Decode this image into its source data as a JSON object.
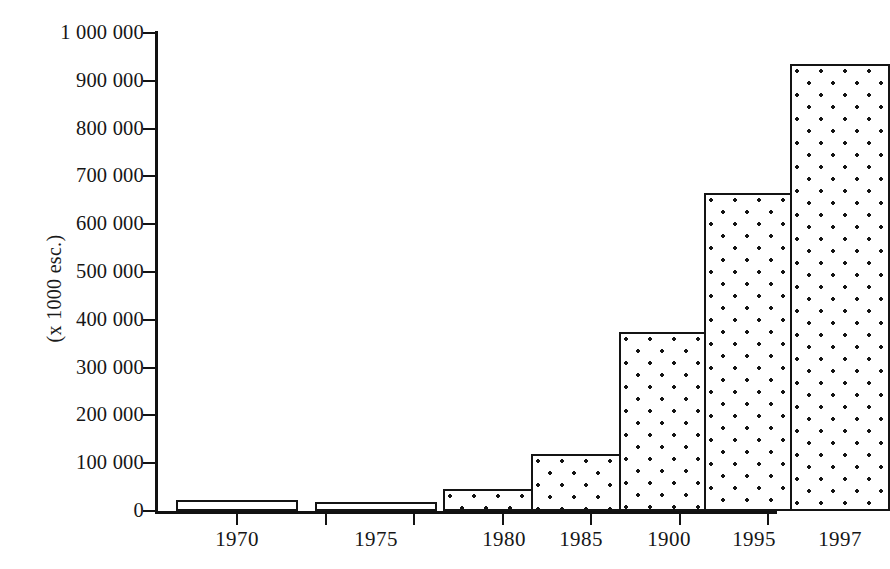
{
  "chart_data": {
    "type": "bar",
    "title": "",
    "subtitle": "",
    "xlabel": "",
    "ylabel": "(x 1000 esc.)",
    "categories": [
      "1970",
      "1975",
      "1980",
      "1985",
      "1900",
      "1995",
      "1997"
    ],
    "values": [
      22000,
      18000,
      45000,
      120000,
      375000,
      665000,
      935000
    ],
    "ylim": [
      0,
      1000000
    ],
    "ytick_values": [
      0,
      100000,
      200000,
      300000,
      400000,
      500000,
      600000,
      700000,
      800000,
      900000,
      1000000
    ],
    "ytick_labels": [
      "0",
      "100 000",
      "200 000",
      "300 000",
      "400 000",
      "500 000",
      "600 000",
      "700 000",
      "800 000",
      "900 000",
      "1 000 000"
    ],
    "grid": false,
    "legend": null,
    "series": [
      {
        "name": "",
        "values": [
          22000,
          18000,
          45000,
          120000,
          375000,
          665000,
          935000
        ]
      }
    ],
    "style": {
      "bar_fill": "#ffffff",
      "bar_pattern": "dots",
      "bar_border": "#141414",
      "axis_color": "#111111",
      "background": "#ffffff"
    }
  },
  "axis": {
    "y_title": "(x 1000 esc.)"
  }
}
